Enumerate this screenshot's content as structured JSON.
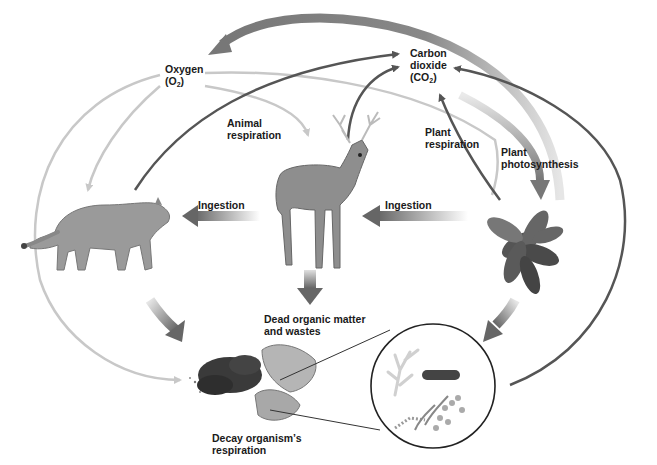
{
  "diagram": {
    "nodes": {
      "oxygen": {
        "line1": "Oxygen",
        "line2_prefix": "(O",
        "line2_sub": "2",
        "line2_suffix": ")"
      },
      "carbon_dioxide": {
        "line1": "Carbon",
        "line2": "dioxide",
        "line3_prefix": "(CO",
        "line3_sub": "2",
        "line3_suffix": ")"
      },
      "deer": {
        "name": "Deer (herbivore)"
      },
      "cougar": {
        "name": "Cougar (carnivore)"
      },
      "plant": {
        "name": "Plant"
      },
      "dead_matter": {
        "line1": "Dead organic matter",
        "line2": "and wastes"
      },
      "decomposers": {
        "name": "Decay organisms (magnified)"
      }
    },
    "labels": {
      "animal_respiration": {
        "line1": "Animal",
        "line2": "respiration"
      },
      "plant_respiration": {
        "line1": "Plant",
        "line2": "respiration"
      },
      "plant_photosynthesis": {
        "line1": "Plant",
        "line2": "photosynthesis"
      },
      "ingestion_left": "Ingestion",
      "ingestion_right": "Ingestion",
      "decay_respiration": {
        "line1": "Decay organism’s",
        "line2": "respiration"
      }
    },
    "colors": {
      "co2_arrow": "#555555",
      "o2_arrow": "#c8c8c8",
      "big_arrow": "#777777",
      "text": "#1a1a1a"
    }
  }
}
